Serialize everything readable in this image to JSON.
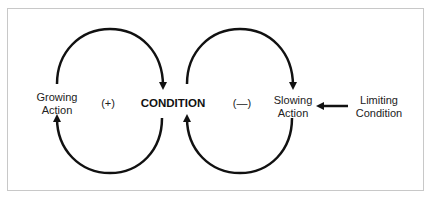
{
  "diagram": {
    "type": "causal-loop",
    "nodes": {
      "growing_action": "Growing Action",
      "growing_line1": "Growing",
      "growing_line2": "Action",
      "condition": "CONDITION",
      "slowing_line1": "Slowing",
      "slowing_line2": "Action",
      "limiting_line1": "Limiting",
      "limiting_line2": "Condition"
    },
    "loops": [
      {
        "name": "reinforcing",
        "polarity": "(+)"
      },
      {
        "name": "balancing",
        "polarity": "(—)"
      }
    ],
    "colors": {
      "stroke": "#111111",
      "border": "#c8c8c8"
    }
  }
}
